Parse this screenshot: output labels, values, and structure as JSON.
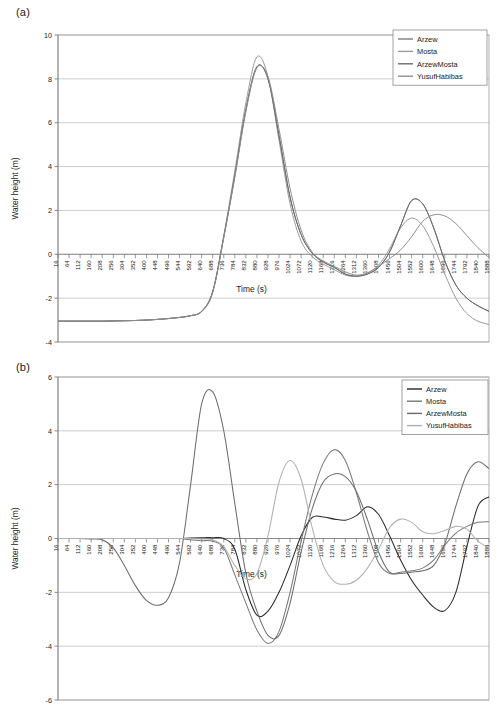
{
  "figure": {
    "panels": [
      {
        "id": "a",
        "label": "(a)",
        "chart_data": {
          "type": "line",
          "title": "",
          "xlabel": "Time (s)",
          "ylabel": "Water height (m)",
          "xlim": [
            16,
            1888
          ],
          "ylim": [
            -4,
            10
          ],
          "yticks": [
            10,
            8,
            6,
            4,
            2,
            0,
            -2,
            -4
          ],
          "grid": true,
          "legend_position": "top-right",
          "categories": [
            16,
            64,
            112,
            160,
            208,
            256,
            304,
            352,
            400,
            448,
            496,
            544,
            592,
            640,
            688,
            736,
            784,
            832,
            880,
            928,
            976,
            1024,
            1072,
            1120,
            1168,
            1216,
            1264,
            1312,
            1360,
            1408,
            1456,
            1504,
            1552,
            1600,
            1648,
            1696,
            1744,
            1792,
            1840,
            1888
          ],
          "series": [
            {
              "name": "Arzew",
              "color": "#7d7d7d",
              "values": [
                -3.05,
                -3.05,
                -3.05,
                -3.05,
                -3.05,
                -3.04,
                -3.03,
                -3.02,
                -3.0,
                -2.97,
                -2.93,
                -2.88,
                -2.8,
                -2.6,
                -1.7,
                0.8,
                3.6,
                6.6,
                8.55,
                8.0,
                5.4,
                2.6,
                0.9,
                0.05,
                -0.35,
                -0.6,
                -0.9,
                -1.0,
                -0.9,
                -0.6,
                0.1,
                1.3,
                2.45,
                2.3,
                1.2,
                -0.3,
                -1.4,
                -2.0,
                -2.35,
                -2.6
              ]
            },
            {
              "name": "Mosta",
              "color": "#9a9a9a",
              "values": [
                -3.05,
                -3.05,
                -3.05,
                -3.05,
                -3.05,
                -3.04,
                -3.03,
                -3.02,
                -3.0,
                -2.97,
                -2.93,
                -2.88,
                -2.8,
                -2.6,
                -1.7,
                0.85,
                3.8,
                6.9,
                9.0,
                8.1,
                5.2,
                2.3,
                0.6,
                -0.1,
                -0.45,
                -0.7,
                -0.95,
                -1.0,
                -0.85,
                -0.5,
                0.25,
                1.2,
                1.65,
                1.3,
                0.35,
                -0.9,
                -2.0,
                -2.7,
                -3.05,
                -3.2
              ]
            },
            {
              "name": "ArzewMosta",
              "color": "#6b6b6b",
              "values": [
                -3.05,
                -3.05,
                -3.05,
                -3.05,
                -3.05,
                -3.04,
                -3.03,
                -3.02,
                -3.0,
                -2.97,
                -2.93,
                -2.88,
                -2.8,
                -2.6,
                -1.7,
                0.8,
                3.6,
                6.6,
                8.55,
                8.0,
                5.4,
                2.6,
                0.9,
                0.05,
                -0.35,
                -0.6,
                -0.9,
                -1.0,
                -0.9,
                -0.6,
                0.1,
                1.3,
                2.45,
                2.3,
                1.2,
                -0.3,
                -1.4,
                -2.0,
                -2.35,
                -2.6
              ]
            },
            {
              "name": "YusufHabibas",
              "color": "#8e8e8e",
              "values": [
                -3.05,
                -3.05,
                -3.05,
                -3.05,
                -3.05,
                -3.04,
                -3.03,
                -3.02,
                -3.0,
                -2.97,
                -2.93,
                -2.88,
                -2.8,
                -2.62,
                -1.75,
                0.75,
                3.5,
                6.5,
                8.5,
                8.1,
                5.7,
                3.0,
                1.1,
                0.1,
                -0.3,
                -0.55,
                -0.8,
                -0.95,
                -0.85,
                -0.55,
                -0.2,
                0.2,
                0.8,
                1.5,
                1.8,
                1.75,
                1.4,
                0.85,
                0.3,
                -0.15
              ]
            }
          ]
        },
        "legend": [
          {
            "label": "Arzew",
            "color": "#7d7d7d"
          },
          {
            "label": "Mosta",
            "color": "#9a9a9a"
          },
          {
            "label": "ArzewMosta",
            "color": "#6b6b6b"
          },
          {
            "label": "YusufHabibas",
            "color": "#8e8e8e"
          }
        ]
      },
      {
        "id": "b",
        "label": "(b)",
        "chart_data": {
          "type": "line",
          "title": "",
          "xlabel": "Time (s)",
          "ylabel": "Water height (m)",
          "xlim": [
            16,
            1888
          ],
          "ylim": [
            -6,
            6
          ],
          "yticks": [
            6,
            4,
            2,
            0,
            -2,
            -4,
            -6
          ],
          "grid": true,
          "legend_position": "top-right",
          "categories": [
            16,
            64,
            112,
            160,
            208,
            256,
            304,
            352,
            400,
            448,
            496,
            544,
            592,
            640,
            688,
            736,
            784,
            832,
            880,
            928,
            976,
            1024,
            1072,
            1120,
            1168,
            1216,
            1264,
            1312,
            1360,
            1408,
            1456,
            1504,
            1552,
            1600,
            1648,
            1696,
            1744,
            1792,
            1840,
            1888
          ],
          "series": [
            {
              "name": "Arzew",
              "color": "#2b2b2b",
              "values": [
                0.0,
                0.0,
                0.0,
                0.0,
                0.0,
                0.0,
                0.0,
                0.0,
                0.0,
                0.0,
                0.0,
                0.0,
                0.02,
                0.03,
                0.03,
                0.0,
                -0.4,
                -1.9,
                -2.85,
                -2.7,
                -2.0,
                -1.0,
                0.1,
                0.78,
                0.8,
                0.72,
                0.68,
                0.85,
                1.18,
                0.9,
                0.1,
                -0.8,
                -1.55,
                -2.1,
                -2.55,
                -2.68,
                -2.0,
                -0.3,
                1.2,
                1.55
              ]
            },
            {
              "name": "Mosta",
              "color": "#7a7a7a",
              "values": [
                0.0,
                0.0,
                0.0,
                0.0,
                0.0,
                0.0,
                0.0,
                0.0,
                0.0,
                0.0,
                0.0,
                0.0,
                -0.05,
                -0.08,
                -0.1,
                -0.35,
                -1.35,
                -2.4,
                -3.4,
                -3.9,
                -3.45,
                -2.0,
                -0.1,
                1.6,
                2.8,
                3.3,
                2.9,
                1.7,
                0.25,
                -0.9,
                -1.3,
                -1.25,
                -1.2,
                -1.1,
                -0.8,
                -0.25,
                0.2,
                0.45,
                0.6,
                0.62
              ]
            },
            {
              "name": "ArzewMosta",
              "color": "#6e6e6e",
              "values": [
                0.0,
                0.0,
                0.0,
                -0.02,
                -0.05,
                -0.35,
                -1.0,
                -1.75,
                -2.3,
                -2.48,
                -2.2,
                -0.9,
                2.0,
                5.0,
                5.45,
                4.0,
                1.3,
                -1.3,
                -2.7,
                -3.6,
                -3.6,
                -2.4,
                -0.5,
                1.1,
                2.1,
                2.4,
                2.3,
                1.75,
                0.7,
                -0.5,
                -1.25,
                -1.3,
                -1.25,
                -1.2,
                -1.0,
                -0.2,
                1.2,
                2.4,
                2.85,
                2.6
              ]
            },
            {
              "name": "YusufHabibas",
              "color": "#b0b0b0",
              "values": [
                0.0,
                0.0,
                0.0,
                0.0,
                0.0,
                0.0,
                0.0,
                0.0,
                0.0,
                0.0,
                0.0,
                0.0,
                0.0,
                -0.02,
                -0.05,
                -0.3,
                -1.0,
                -1.5,
                -1.3,
                0.1,
                2.1,
                2.9,
                2.2,
                0.4,
                -1.0,
                -1.6,
                -1.7,
                -1.55,
                -1.1,
                -0.4,
                0.4,
                0.72,
                0.6,
                0.25,
                0.18,
                0.3,
                0.45,
                0.35,
                -0.1,
                -0.35
              ]
            }
          ]
        },
        "legend": [
          {
            "label": "Arzew",
            "color": "#2b2b2b"
          },
          {
            "label": "Mosta",
            "color": "#7a7a7a"
          },
          {
            "label": "ArzewMosta",
            "color": "#6e6e6e"
          },
          {
            "label": "YusufHabibas",
            "color": "#b0b0b0"
          }
        ]
      }
    ]
  }
}
